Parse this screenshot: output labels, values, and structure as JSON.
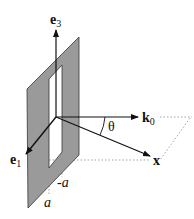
{
  "diagram": {
    "colors": {
      "plate": "#9a9a9a",
      "plate_edge": "#333333",
      "axis": "#111111",
      "dotted": "#999999"
    },
    "labels": {
      "e3": {
        "main": "e",
        "sub": "3"
      },
      "e1": {
        "main": "e",
        "sub": "1"
      },
      "k0": {
        "main": "k",
        "sub": "0"
      },
      "x": "x",
      "theta": "θ",
      "a": "a",
      "minus_a": "-a"
    }
  }
}
